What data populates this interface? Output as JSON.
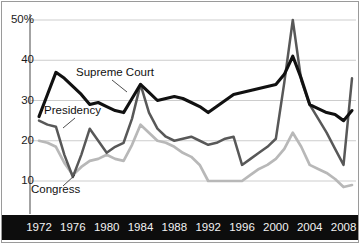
{
  "chart_data": {
    "type": "line",
    "title": "",
    "xlabel": "",
    "ylabel": "",
    "xlim": [
      1972,
      2009
    ],
    "ylim": [
      4,
      53
    ],
    "grid": true,
    "gridlines": [
      10,
      20,
      30,
      40,
      50
    ],
    "ytick_labels": [
      "50%",
      "40",
      "30",
      "20",
      "10"
    ],
    "ytick_values": [
      50,
      40,
      30,
      20,
      10
    ],
    "xtick_labels": [
      "1972",
      "1976",
      "1980",
      "1984",
      "1988",
      "1992",
      "1996",
      "2000",
      "2004",
      "2008"
    ],
    "xtick_values": [
      1972,
      1976,
      1980,
      1984,
      1988,
      1992,
      1996,
      2000,
      2004,
      2008
    ],
    "x": [
      1972,
      1973,
      1974,
      1975,
      1976,
      1977,
      1978,
      1979,
      1980,
      1981,
      1982,
      1983,
      1984,
      1985,
      1986,
      1987,
      1988,
      1989,
      1990,
      1991,
      1992,
      1993,
      1994,
      1995,
      1996,
      1997,
      1998,
      1999,
      2000,
      2001,
      2002,
      2003,
      2004,
      2005,
      2006,
      2007,
      2008,
      2009
    ],
    "legend_position": "inline-annotations",
    "series": [
      {
        "name": "Supreme Court",
        "color": "#111111",
        "width": 3.1,
        "values": [
          26,
          31.5,
          37,
          35.5,
          33.5,
          31.5,
          29,
          29.5,
          28.5,
          27.5,
          27,
          30.5,
          34,
          32,
          30,
          30.5,
          31,
          30.5,
          29.5,
          28.5,
          27,
          28.5,
          30,
          31.5,
          32,
          32.5,
          33,
          33.5,
          34,
          36.5,
          41,
          35.5,
          29,
          28,
          27,
          26.5,
          25,
          27.5
        ]
      },
      {
        "name": "Presidency",
        "color": "#585858",
        "width": 2.5,
        "values": [
          25,
          24,
          23.5,
          16.5,
          11,
          16.5,
          23,
          20,
          17,
          18.5,
          19.5,
          25.5,
          34,
          27,
          23,
          21,
          20,
          20.5,
          21,
          20,
          19,
          19.5,
          20.5,
          21,
          14,
          15.5,
          17,
          18.5,
          20.5,
          34.5,
          50,
          35,
          29,
          25.5,
          22,
          18,
          14,
          35.5
        ]
      },
      {
        "name": "Congress",
        "color": "#b8b8b8",
        "width": 2.7,
        "values": [
          20,
          19.5,
          18.5,
          14.5,
          11.5,
          13.5,
          15,
          15.5,
          16.5,
          15.5,
          15,
          19,
          24,
          22,
          20,
          19.5,
          18.5,
          17,
          16,
          14,
          10,
          10,
          10,
          10,
          10,
          11.5,
          13,
          14,
          15.5,
          18,
          22,
          18.5,
          14,
          13,
          12,
          10.5,
          8.5,
          9
        ]
      }
    ],
    "annotations": [
      {
        "text": "Supreme Court",
        "x_px": 76,
        "y_px": 66,
        "leader": [
          [
            112,
            80
          ],
          [
            127,
            92
          ]
        ]
      },
      {
        "text": "Presidency",
        "x_px": 44,
        "y_px": 104,
        "leader": [
          [
            75,
            118
          ],
          [
            63,
            128
          ]
        ]
      },
      {
        "text": "Congress",
        "x_px": 31,
        "y_px": 183,
        "leader": [
          [
            75,
            175
          ],
          [
            63,
            186
          ]
        ]
      }
    ]
  },
  "axis": {
    "y_axis_line_color": "#8c8c8c",
    "grid_color": "#cdcdcd",
    "band_color": "#0d0d0d",
    "band_text_color": "#f2f2f2",
    "border_color": "#9a9a9a"
  }
}
